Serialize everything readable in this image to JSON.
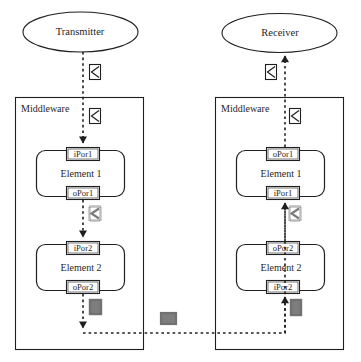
{
  "diagram": {
    "colors": {
      "stroke": "#1f1f1f",
      "background": "#ffffff",
      "smudge": "#4a4a4a"
    },
    "endpoints": {
      "transmitter": {
        "label": "Transmitter",
        "shape": "ellipse"
      },
      "receiver": {
        "label": "Receiver",
        "shape": "ellipse"
      }
    },
    "containers": [
      {
        "id": "middleware-left",
        "label": "Middleware",
        "side": "transmitter",
        "elements": [
          {
            "id": "left-element-1",
            "label": "Element 1",
            "ports": [
              {
                "id": "left-e1-in",
                "label": "iPor1",
                "kind": "input",
                "position": "top"
              },
              {
                "id": "left-e1-out",
                "label": "oPor1",
                "kind": "output",
                "position": "bottom"
              }
            ]
          },
          {
            "id": "left-element-2",
            "label": "Element 2",
            "ports": [
              {
                "id": "left-e2-in",
                "label": "iPor2",
                "kind": "input",
                "position": "top"
              },
              {
                "id": "left-e2-out",
                "label": "oPor2",
                "kind": "output",
                "position": "bottom"
              }
            ]
          }
        ]
      },
      {
        "id": "middleware-right",
        "label": "Middleware",
        "side": "receiver",
        "elements": [
          {
            "id": "right-element-1",
            "label": "Element 1",
            "ports": [
              {
                "id": "right-e1-out",
                "label": "oPor1",
                "kind": "output",
                "position": "top"
              },
              {
                "id": "right-e1-in",
                "label": "iPor1",
                "kind": "input",
                "position": "bottom"
              }
            ]
          },
          {
            "id": "right-element-2",
            "label": "Element 2",
            "ports": [
              {
                "id": "right-e2-out",
                "label": "oPor2",
                "kind": "output",
                "position": "top"
              },
              {
                "id": "right-e2-in",
                "label": "iPor2",
                "kind": "input",
                "position": "bottom"
              }
            ]
          }
        ]
      }
    ],
    "message_icons": [
      {
        "id": "msg-left-transmitter-to-mw",
        "icon": "message-envelope-icon",
        "near": "transmitter-to-middleware-left"
      },
      {
        "id": "msg-left-inside-mw",
        "icon": "message-envelope-icon",
        "near": "middleware-left-to-element-1"
      },
      {
        "id": "msg-left-e1-to-e2",
        "icon": "message-envelope-icon",
        "near": "left-element-1-to-element-2"
      },
      {
        "id": "msg-left-e2-out",
        "icon": "message-envelope-icon",
        "near": "left-element-2-outbound"
      },
      {
        "id": "msg-network",
        "icon": "message-envelope-icon",
        "near": "network-link"
      },
      {
        "id": "msg-right-e2-in",
        "icon": "message-envelope-icon",
        "near": "right-element-2-inbound"
      },
      {
        "id": "msg-right-e1-to-e2",
        "icon": "message-envelope-icon",
        "near": "right-element-2-to-element-1"
      },
      {
        "id": "msg-right-inside-mw",
        "icon": "message-envelope-icon",
        "near": "right-element-1-to-middleware"
      },
      {
        "id": "msg-right-mw-to-receiver",
        "icon": "message-envelope-icon",
        "near": "middleware-right-to-receiver"
      }
    ],
    "flow": {
      "direction": "transmitter -> middleware-left (Element 1 -> Element 2) -> network -> middleware-right (Element 2 -> Element 1) -> receiver",
      "line_style": "dashed",
      "arrowhead": "filled-triangle"
    }
  }
}
